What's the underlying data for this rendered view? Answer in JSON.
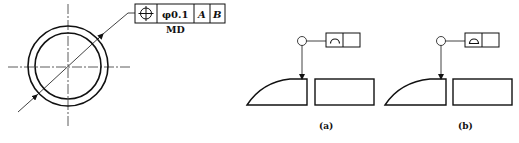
{
  "figure_left": {
    "tolerance_frame": {
      "symbol": "position-icon",
      "tolerance_value": "φ0.1",
      "datums": [
        "A",
        "B"
      ],
      "modifier_label": "MD"
    }
  },
  "figure_a": {
    "caption": "(a)",
    "frame_symbol": "profile-of-line-icon"
  },
  "figure_b": {
    "caption": "(b)",
    "frame_symbol": "profile-of-surface-icon"
  }
}
